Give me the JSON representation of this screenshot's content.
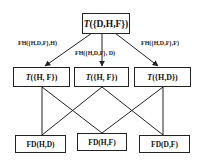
{
  "diagram": {
    "top": {
      "prefix": "T",
      "label": "({D,H,F})"
    },
    "middle": [
      {
        "prefix": "T",
        "label": "({H, F})"
      },
      {
        "prefix": "T",
        "label": "({H, F})"
      },
      {
        "prefix": "T",
        "label": "({H,D})"
      }
    ],
    "bottom": [
      {
        "label": "FD(H,D)"
      },
      {
        "label": "FD(H,F)"
      },
      {
        "label": "FD(D,F)"
      }
    ],
    "edge_labels": [
      {
        "label": "FH({H,D,F},H)"
      },
      {
        "label": "FH({H,D,F}, D)"
      },
      {
        "label": "FH({H,D,F},F)"
      }
    ]
  }
}
